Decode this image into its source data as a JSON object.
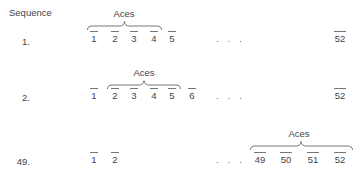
{
  "figure": {
    "header": "Sequence",
    "group_label": "Aces",
    "ellipsis": "· · ·",
    "rows": [
      {
        "label": "1.",
        "slots": [
          "1",
          "2",
          "3",
          "4",
          "5"
        ],
        "last_slot": "52",
        "aces_positions": [
          "1",
          "2",
          "3",
          "4"
        ]
      },
      {
        "label": "2.",
        "slots": [
          "1",
          "2",
          "3",
          "4",
          "5",
          "6"
        ],
        "last_slot": "52",
        "aces_positions": [
          "2",
          "3",
          "4",
          "5"
        ]
      },
      {
        "label": "49.",
        "slots": [
          "1",
          "2"
        ],
        "tail_slots": [
          "49",
          "50",
          "51",
          "52"
        ],
        "aces_positions": [
          "49",
          "50",
          "51",
          "52"
        ]
      }
    ]
  }
}
